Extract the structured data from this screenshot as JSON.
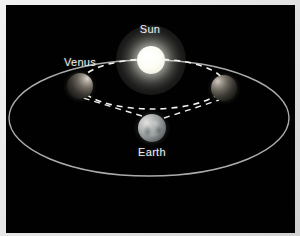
{
  "figure": {
    "domain": "diagram",
    "background_color": "#010101",
    "frame_color": "#e8e8e8",
    "width": 300,
    "height": 236
  },
  "labels": {
    "sun": "Sun",
    "venus": "Venus",
    "earth": "Earth"
  },
  "label_positions": {
    "sun": {
      "x": 150,
      "y": 29
    },
    "venus": {
      "x": 80,
      "y": 62
    },
    "earth": {
      "x": 152,
      "y": 152
    }
  },
  "bodies": [
    {
      "name": "sun",
      "label": "Sun",
      "cx": 151,
      "cy": 60,
      "r": 14,
      "color": "#fdfdf6",
      "glow": true,
      "lit_from": "self"
    },
    {
      "name": "venus-left",
      "label": "Venus",
      "cx": 80,
      "cy": 86,
      "r": 13,
      "color": "#3c3934",
      "glow": false,
      "lit_from": "upper-right"
    },
    {
      "name": "venus-right",
      "label": "",
      "cx": 224,
      "cy": 88,
      "r": 13,
      "color": "#3a3732",
      "glow": false,
      "lit_from": "upper-left"
    },
    {
      "name": "earth",
      "label": "Earth",
      "cx": 152,
      "cy": 128,
      "r": 14,
      "color": "#9ea3a4",
      "glow": false,
      "lit_from": "upper-left"
    }
  ],
  "orbits": [
    {
      "name": "earth-orbit",
      "style": "solid",
      "cx": 149,
      "cy": 118,
      "rx": 140,
      "ry": 58,
      "stroke": "#b9bbb8",
      "stroke_width": 1.4
    },
    {
      "name": "venus-orbit",
      "style": "dashed",
      "cx": 152,
      "cy": 84,
      "rx": 72,
      "ry": 25,
      "stroke": "#f2f2ee",
      "stroke_width": 1.6,
      "dash": "6 5"
    }
  ],
  "sight_lines": [
    {
      "name": "sight-line-earth-to-venus-left",
      "from": {
        "x": 142,
        "y": 116
      },
      "to": {
        "x": 83,
        "y": 98
      },
      "style": "dashed",
      "stroke": "#ededea",
      "stroke_width": 1.4,
      "dash": "6 5"
    },
    {
      "name": "sight-line-earth-to-venus-right",
      "from": {
        "x": 164,
        "y": 118
      },
      "to": {
        "x": 219,
        "y": 100
      },
      "style": "dashed",
      "stroke": "#ededea",
      "stroke_width": 1.4,
      "dash": "6 5"
    }
  ]
}
